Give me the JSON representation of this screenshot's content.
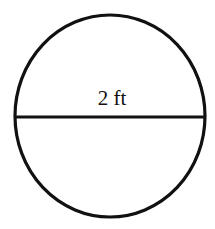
{
  "diagram": {
    "shape": "circle",
    "diameter_label": "2 ft",
    "stroke_color": "#111111",
    "background_color": "#ffffff"
  }
}
